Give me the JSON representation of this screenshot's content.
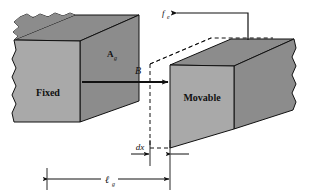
{
  "figure": {
    "type": "engineering-diagram",
    "background_color": "#ffffff",
    "line_color": "#111111",
    "face_colors": {
      "front": "#a9a9a9",
      "top": "#8c8c8c",
      "side": "#8c8c8c",
      "ghost": "#ffffff"
    }
  },
  "blocks": {
    "fixed": {
      "label": "Fixed",
      "description": "stationary magnetic core with torn left edge"
    },
    "movable": {
      "label": "Movable",
      "description": "movable magnetic core displaced by dx"
    }
  },
  "labels": {
    "area": {
      "symbol": "A",
      "subscript": "g",
      "full": "Ag"
    },
    "flux": {
      "symbol": "B",
      "subscript": "",
      "full": "B"
    },
    "force": {
      "symbol": "f",
      "subscript": "e",
      "full": "fe"
    },
    "displacement": {
      "symbol": "dx",
      "subscript": "",
      "full": "dx"
    },
    "gap_length": {
      "symbol": "ℓ",
      "subscript": "g",
      "full": "ℓg"
    }
  },
  "annotations": {
    "ghost_outline": "dashed outline showing previous position of movable block",
    "b_arrow": "flux density arrow pointing right across the air gap",
    "f_arrow": "force arrow pointing left at top of movable block",
    "dx_dimension": "small dimension from dashed face to solid face",
    "lg_dimension": "overall air-gap length dimension"
  }
}
